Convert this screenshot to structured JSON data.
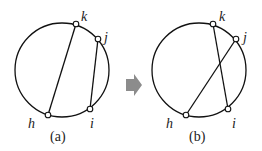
{
  "panels": [
    {
      "caption": "(a)",
      "labels": {
        "k": "k",
        "j": "j",
        "i": "i",
        "h": "h"
      },
      "chords": [
        [
          "h",
          "k"
        ],
        [
          "i",
          "j"
        ]
      ]
    },
    {
      "caption": "(b)",
      "labels": {
        "k": "k",
        "j": "j",
        "i": "i",
        "h": "h"
      },
      "chords": [
        [
          "k",
          "i"
        ],
        [
          "h",
          "j"
        ]
      ]
    }
  ],
  "arrow_color": "#8c8c8c",
  "stroke_color": "#111111"
}
